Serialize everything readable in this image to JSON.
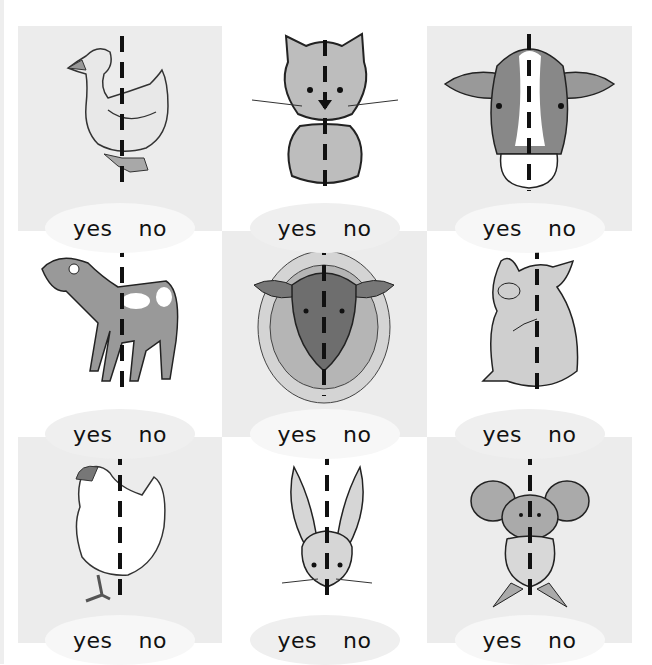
{
  "worksheet": {
    "instruction": "Is the animal symmetrical? Circle yes or no.",
    "answer_options": {
      "yes": "yes",
      "no": "no"
    },
    "colors": {
      "cell_gray": "#ececec",
      "cell_white": "#ffffff",
      "line": "#111111",
      "animal_fill": "#b9b9b9",
      "animal_dark": "#8e8e8e"
    },
    "cells": [
      {
        "animal": "duck",
        "icon": "duck-icon",
        "yes": "yes",
        "no": "no",
        "shade": "gray"
      },
      {
        "animal": "cat",
        "icon": "cat-icon",
        "yes": "yes",
        "no": "no",
        "shade": "white"
      },
      {
        "animal": "cow",
        "icon": "cow-icon",
        "yes": "yes",
        "no": "no",
        "shade": "gray"
      },
      {
        "animal": "goat",
        "icon": "goat-icon",
        "yes": "yes",
        "no": "no",
        "shade": "white"
      },
      {
        "animal": "sheep",
        "icon": "sheep-icon",
        "yes": "yes",
        "no": "no",
        "shade": "gray"
      },
      {
        "animal": "pig",
        "icon": "pig-icon",
        "yes": "yes",
        "no": "no",
        "shade": "white"
      },
      {
        "animal": "hen",
        "icon": "hen-icon",
        "yes": "yes",
        "no": "no",
        "shade": "gray"
      },
      {
        "animal": "rabbit",
        "icon": "rabbit-icon",
        "yes": "yes",
        "no": "no",
        "shade": "white"
      },
      {
        "animal": "mouse",
        "icon": "mouse-icon",
        "yes": "yes",
        "no": "no",
        "shade": "gray"
      }
    ]
  }
}
